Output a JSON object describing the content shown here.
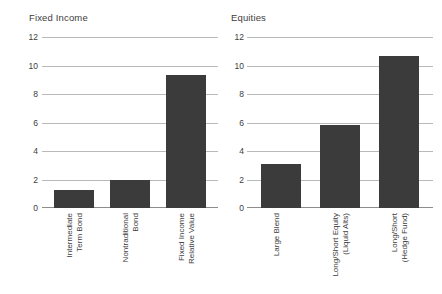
{
  "chart_data": {
    "type": "bar",
    "title": "",
    "xlabel": "",
    "ylabel": "Return (%)",
    "ylim": [
      0,
      12
    ],
    "yticks": [
      0,
      2,
      4,
      6,
      8,
      10,
      12
    ],
    "grid": true,
    "legend": "none",
    "bar_color": "#3b3b3b",
    "gridline_color": "#b9b9b9",
    "panels": [
      {
        "title": "Fixed Income",
        "categories": [
          "Intermediate Term Bond",
          "Nontraditional Bond",
          "Fixed Income Relative Value"
        ],
        "values": [
          1.25,
          2.0,
          9.3
        ]
      },
      {
        "title": "Equities",
        "categories": [
          "Large Blend",
          "Long/Short Equity (Liquid Alts)",
          "Long/Short (Hedge Fund)"
        ],
        "values": [
          3.1,
          5.8,
          10.7
        ]
      }
    ]
  },
  "panel_left": {
    "title": "Fixed Income",
    "axis_title": "Return (%)",
    "ticks": [
      "12",
      "10",
      "8",
      "6",
      "4",
      "2",
      "0"
    ],
    "bars": [
      {
        "label_line1": "Intermediate",
        "label_line2": "Term Bond",
        "value": 1.25
      },
      {
        "label_line1": "Nontraditional",
        "label_line2": "Bond",
        "value": 2.0
      },
      {
        "label_line1": "Fixed Income",
        "label_line2": "Relative Value",
        "value": 9.3
      }
    ]
  },
  "panel_right": {
    "title": "Equities",
    "ticks": [
      "12",
      "10",
      "8",
      "6",
      "4",
      "2",
      "0"
    ],
    "bars": [
      {
        "label_line1": "Large Blend",
        "label_line2": "",
        "value": 3.1
      },
      {
        "label_line1": "Long/Short Equity",
        "label_line2": "(Liquid Alts)",
        "value": 5.8
      },
      {
        "label_line1": "Long/Short",
        "label_line2": "(Hedge Fund)",
        "value": 10.7
      }
    ]
  }
}
